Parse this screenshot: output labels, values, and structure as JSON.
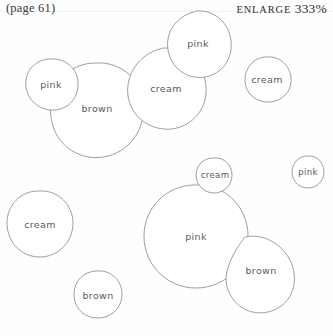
{
  "header": {
    "page_ref": "(page 61)",
    "enlarge_label": "ENLARGE",
    "enlarge_value": "333%"
  },
  "colors": {
    "background": "#fefefe",
    "outline": "#8c8c8c",
    "label_text": "#5a5a5a",
    "header_text": "#2c2c2c",
    "rule": "#f2f2f2"
  },
  "clusters": [
    {
      "name": "upper-cluster",
      "blobs": [
        {
          "label": "pink",
          "cx": 51,
          "cy": 84,
          "r": 26
        },
        {
          "label": "brown",
          "cx": 97,
          "cy": 108,
          "r": 45
        },
        {
          "label": "cream",
          "cx": 166,
          "cy": 88,
          "r": 40
        },
        {
          "label": "pink",
          "cx": 198,
          "cy": 43,
          "r": 33
        },
        {
          "label": "cream",
          "cx": 267,
          "cy": 79,
          "r": 23
        }
      ]
    },
    {
      "name": "lower-cluster",
      "blobs": [
        {
          "label": "cream",
          "cx": 40,
          "cy": 224,
          "r": 33
        },
        {
          "label": "brown",
          "cx": 98,
          "cy": 295,
          "r": 24
        },
        {
          "label": "cream",
          "cx": 215,
          "cy": 175,
          "r": 17
        },
        {
          "label": "pink",
          "cx": 196,
          "cy": 236,
          "r": 52
        },
        {
          "label": "brown",
          "cx": 261,
          "cy": 270,
          "r": 35
        },
        {
          "label": "pink",
          "cx": 308,
          "cy": 172,
          "r": 16
        }
      ]
    }
  ]
}
